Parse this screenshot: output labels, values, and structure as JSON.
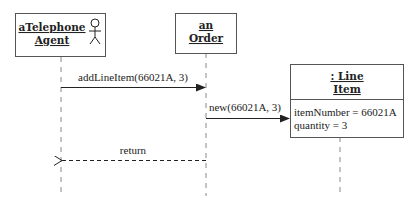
{
  "diagram": {
    "type": "UML sequence diagram",
    "participants": [
      {
        "id": "agent",
        "line1": "aTelephone",
        "line2": "Agent",
        "actor_icon": "stick-figure-icon"
      },
      {
        "id": "order",
        "line1": "an",
        "line2": "Order"
      },
      {
        "id": "lineitem",
        "line1": ": Line",
        "line2": "Item",
        "attributes": [
          "itemNumber = 66021A",
          "quantity = 3"
        ]
      }
    ],
    "messages": [
      {
        "from": "agent",
        "to": "order",
        "label": "addLineItem(66021A, 3)",
        "style": "solid"
      },
      {
        "from": "order",
        "to": "lineitem",
        "label": "new(66021A, 3)",
        "style": "solid",
        "creates": true
      },
      {
        "from": "order",
        "to": "agent",
        "label": "return",
        "style": "dashed"
      }
    ]
  }
}
